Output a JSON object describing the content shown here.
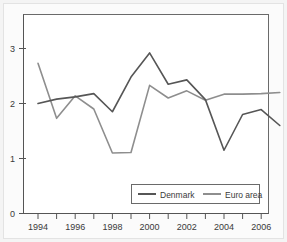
{
  "chart_data": {
    "type": "line",
    "title": "",
    "subtitle": "",
    "xlabel": "",
    "ylabel": "",
    "xlim": [
      1993.6,
      2007.4
    ],
    "ylim": [
      0,
      3.45
    ],
    "yticks": [
      0,
      1,
      2,
      3
    ],
    "ytick_labels": [
      "0",
      "1",
      "2",
      "3"
    ],
    "xticks": [
      1994,
      1995,
      1996,
      1997,
      1998,
      1999,
      2000,
      2001,
      2002,
      2003,
      2004,
      2005,
      2006,
      2007
    ],
    "xtick_labels_major": [
      "1994",
      "1996",
      "1998",
      "2000",
      "2002",
      "2004",
      "2006"
    ],
    "xticks_major": [
      1994,
      1996,
      1998,
      2000,
      2002,
      2004,
      2006
    ],
    "grid": false,
    "legend_position": "bottom-right",
    "x": [
      1994,
      1995,
      1996,
      1997,
      1998,
      1999,
      2000,
      2001,
      2002,
      2003,
      2004,
      2005,
      2006,
      2007
    ],
    "series": [
      {
        "name": "Denmark",
        "color": "#565656",
        "values": [
          2.0,
          2.08,
          2.12,
          2.18,
          1.85,
          2.48,
          2.92,
          2.35,
          2.43,
          2.07,
          1.15,
          1.8,
          1.89,
          1.6
        ]
      },
      {
        "name": "Euro area",
        "color": "#8e8e8e",
        "values": [
          2.73,
          1.73,
          2.14,
          1.9,
          1.1,
          1.11,
          2.33,
          2.1,
          2.23,
          2.06,
          2.17,
          2.17,
          2.18,
          2.2
        ]
      }
    ]
  },
  "legend": {
    "items": [
      {
        "label": "Denmark",
        "color": "#565656"
      },
      {
        "label": "Euro area",
        "color": "#8e8e8e"
      }
    ]
  },
  "axes": {
    "y_tick_labels": [
      "3",
      "2",
      "1",
      "0"
    ],
    "x_tick_labels": [
      "1994",
      "1996",
      "1998",
      "2000",
      "2002",
      "2004",
      "2006"
    ]
  },
  "colors": {
    "denmark": "#565656",
    "euro_area": "#8e8e8e",
    "axis": "#555555",
    "frame": "#6a6a6a",
    "page_background": "#f4f4f4",
    "plot_background": "#ffffff"
  }
}
